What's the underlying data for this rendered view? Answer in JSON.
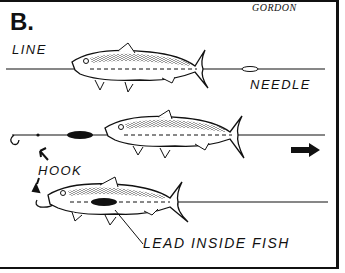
{
  "panel_label": "B.",
  "signature": "GORDON",
  "labels": {
    "line": "LINE",
    "needle": "NEEDLE",
    "hook": "HOOK",
    "lead": "LEAD INSIDE FISH"
  },
  "steps": [
    {
      "description": "Line threaded through fish with baiting needle"
    },
    {
      "description": "Lead weight and hook on line, fish pulled along line",
      "direction": "right-arrow"
    },
    {
      "description": "Lead drawn inside fish, hook at mouth"
    }
  ],
  "colors": {
    "ink": "#111111",
    "background": "#ffffff"
  }
}
